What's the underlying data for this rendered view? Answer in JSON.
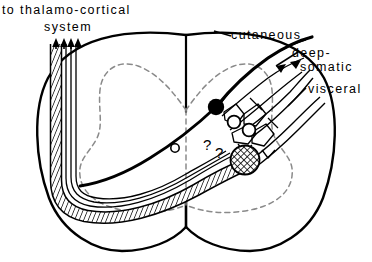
{
  "figure": {
    "name": "spinal-cord-cross-section-ascending-pathway-diagram",
    "background_color": "#ffffff",
    "line_color": "#000000",
    "gray_matter_outline_color": "#8c8c8c",
    "width": 372,
    "height": 262
  },
  "labels": {
    "thalamo_cortical_line1": "to thalamo-cortical",
    "thalamo_cortical_line2": "system",
    "cutaneous": "cutaneous",
    "deep": "deep-",
    "somatic": "somatic",
    "visceral": "visceral"
  },
  "annotations": {
    "question_mark_1": "?",
    "question_mark_2": "?"
  },
  "elements": {
    "cord_outline": "spinal-cord-outline",
    "gray_matter": "gray-matter-butterfly-dashed",
    "dorsal_median_sulcus": "dorsal-median-sulcus",
    "ventral_median_fissure": "ventral-median-fissure",
    "ascending_tract": "hatched-ascending-tract",
    "tract_arrowheads": 4,
    "projection_neuron_soma": "filled-black-neuron-soma",
    "open_neuron_1": "open-circle-neuron",
    "open_neuron_2": "open-circle-neuron",
    "open_neuron_3": "open-circle-neuron-small",
    "interneuron": "crosshatched-interneuron",
    "afferent_cutaneous": "cutaneous-afferent-fiber",
    "afferent_deep_somatic": "deep-somatic-afferent-fiber",
    "afferent_visceral": "visceral-afferent-fiber"
  }
}
